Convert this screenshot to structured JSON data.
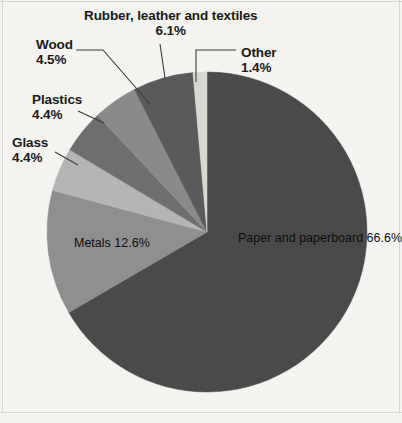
{
  "chart_data": {
    "type": "pie",
    "title": "",
    "subtitle": "",
    "xlabel": "",
    "ylabel": "",
    "legend_position": "none",
    "grid": false,
    "units": "percent",
    "start_angle_deg": 0,
    "direction": "clockwise",
    "center": {
      "x": 207,
      "y": 232
    },
    "radius": 160,
    "categories": [
      "Paper and paperboard",
      "Metals",
      "Glass",
      "Plastics",
      "Wood",
      "Rubber, leather and textiles",
      "Other"
    ],
    "values": [
      66.6,
      12.6,
      4.4,
      4.4,
      4.5,
      6.1,
      1.4
    ],
    "slices": [
      {
        "key": "paper",
        "label": "Paper and\npaperboard",
        "label_line1": "Paper and",
        "label_line2": "paperboard",
        "value": 66.6,
        "value_text": "66.6%",
        "color": "#4a4a4a",
        "label_placement": "inside"
      },
      {
        "key": "metals",
        "label": "Metals",
        "value": 12.6,
        "value_text": "12.6%",
        "color": "#8f8f8f",
        "label_placement": "inside"
      },
      {
        "key": "glass",
        "label": "Glass",
        "value": 4.4,
        "value_text": "4.4%",
        "color": "#b5b5b5",
        "label_placement": "outside-leader"
      },
      {
        "key": "plastics",
        "label": "Plastics",
        "value": 4.4,
        "value_text": "4.4%",
        "color": "#6e6e6e",
        "label_placement": "outside-leader"
      },
      {
        "key": "wood",
        "label": "Wood",
        "value": 4.5,
        "value_text": "4.5%",
        "color": "#8a8a8a",
        "label_placement": "outside-leader"
      },
      {
        "key": "rubber",
        "label": "Rubber, leather and textiles",
        "label_line1": "Rubber, leather and textiles",
        "value": 6.1,
        "value_text": "6.1%",
        "color": "#5a5a5a",
        "label_placement": "outside-leader"
      },
      {
        "key": "other",
        "label": "Other",
        "value": 1.4,
        "value_text": "1.4%",
        "color": "#d9d9d2",
        "label_placement": "outside-leader"
      }
    ]
  },
  "figure": {
    "background_color": "#f4f3f0",
    "text_color": "#1a1a1a",
    "border_color": "#d6d5d1",
    "leader_color": "#3a3a3a"
  }
}
